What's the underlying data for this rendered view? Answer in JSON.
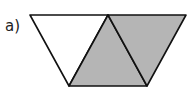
{
  "diagram": {
    "label": "a)",
    "shape": "trapezoid made of 3 equilateral triangles",
    "colors": {
      "shaded": "#b5b5b5",
      "unshaded": "#ffffff",
      "stroke": "#111111"
    },
    "triangles": [
      {
        "id": "left",
        "points": "30,15 108,15 69,86",
        "shaded": false
      },
      {
        "id": "middle",
        "points": "108,15 69,86 147,86",
        "shaded": true
      },
      {
        "id": "right",
        "points": "108,15 186,15 147,86",
        "shaded": true
      }
    ],
    "shaded_count": 2,
    "total_count": 3
  }
}
